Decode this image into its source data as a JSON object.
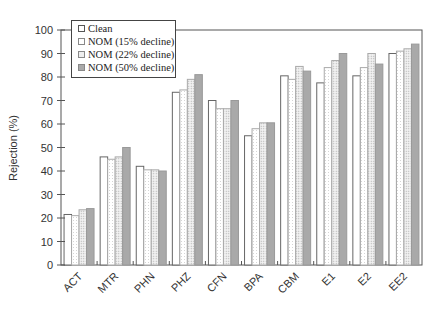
{
  "chart_data": {
    "type": "bar",
    "title": "",
    "xlabel": "",
    "ylabel": "Rejection (%)",
    "ylim": [
      0,
      100
    ],
    "yticks": [
      0,
      10,
      20,
      30,
      40,
      50,
      60,
      70,
      80,
      90,
      100
    ],
    "grid": false,
    "legend_position": "upper-left (inside)",
    "categories": [
      "ACT",
      "MTR",
      "PHN",
      "PHZ",
      "CFN",
      "BPA",
      "CBM",
      "E1",
      "E2",
      "EE2"
    ],
    "series": [
      {
        "name": "Clean",
        "fill": "#ffffff",
        "values": [
          21.5,
          46,
          42,
          73.5,
          70,
          55,
          80.5,
          77.5,
          80.5,
          90
        ]
      },
      {
        "name": "NOM (15% decline)",
        "fill": "#f7f7f7",
        "values": [
          21,
          45,
          40.5,
          74.5,
          66.5,
          58,
          79,
          84,
          84,
          91
        ]
      },
      {
        "name": "NOM (22% decline)",
        "fill": "#e6e6e6",
        "values": [
          23.5,
          46,
          40.5,
          79,
          66.5,
          60.5,
          84.5,
          87,
          90,
          92
        ]
      },
      {
        "name": "NOM (50% decline)",
        "fill": "#a9a9a9",
        "values": [
          24,
          50,
          40,
          81,
          70,
          60.5,
          82.5,
          90,
          85.5,
          94
        ]
      }
    ]
  },
  "legend": {
    "items": [
      "Clean",
      "NOM (15% decline)",
      "NOM (22% decline)",
      "NOM (50% decline)"
    ]
  },
  "axis": {
    "y_label": "Rejection (%)"
  }
}
